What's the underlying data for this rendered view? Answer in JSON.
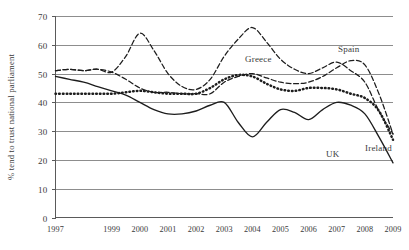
{
  "chart_data": {
    "type": "line",
    "title": "",
    "xlabel": "",
    "ylabel": "% tend to trust national parliament",
    "ylim": [
      0,
      70
    ],
    "xlim": [
      1997,
      2009
    ],
    "grid": true,
    "legend_position": "inline-annotations",
    "y_ticks": [
      "0",
      "10",
      "20",
      "30",
      "40",
      "50",
      "60",
      "70"
    ],
    "y_tick_values": [
      0,
      10,
      20,
      30,
      40,
      50,
      60,
      70
    ],
    "x_ticks": [
      "1997",
      "1999",
      "2000",
      "2001",
      "2002",
      "2003",
      "2004",
      "2005",
      "2006",
      "2007",
      "2008",
      "2009"
    ],
    "x_tick_values": [
      1997,
      1999,
      2000,
      2001,
      2002,
      2003,
      2004,
      2005,
      2006,
      2007,
      2008,
      2009
    ],
    "x": [
      1997,
      1997.5,
      1998,
      1998.5,
      1999,
      1999.5,
      2000,
      2000.5,
      2001,
      2001.5,
      2002,
      2002.5,
      2003,
      2003.5,
      2004,
      2004.5,
      2005,
      2005.5,
      2006,
      2006.5,
      2007,
      2007.5,
      2008,
      2008.5,
      2009
    ],
    "series": [
      {
        "name": "Greece",
        "style": "dashed",
        "color": "#1d1d1d",
        "values": [
          51,
          51.5,
          51,
          51.5,
          50.5,
          56,
          64,
          58,
          50,
          45.5,
          44.5,
          48,
          56,
          62,
          66,
          61,
          55,
          51.5,
          50,
          52,
          54,
          51,
          47,
          37,
          29
        ]
      },
      {
        "name": "Spain",
        "style": "dashed",
        "color": "#1d1d1d",
        "values": [
          51,
          51.5,
          51,
          51.5,
          50.5,
          48,
          45,
          43.5,
          43.5,
          43,
          43,
          43,
          47,
          49,
          50,
          48.5,
          47,
          46.5,
          47,
          49,
          52,
          54.5,
          53,
          43,
          29
        ]
      },
      {
        "name": "Ireland",
        "style": "dotted",
        "color": "#1d1d1d",
        "values": [
          43,
          43,
          43,
          43,
          43,
          43.5,
          44,
          43.5,
          43,
          43,
          43,
          45,
          48,
          49.5,
          49,
          46.5,
          44.5,
          44,
          45,
          45,
          44.5,
          43,
          41.5,
          37,
          27
        ]
      },
      {
        "name": "UK",
        "style": "solid",
        "color": "#1d1d1d",
        "values": [
          49,
          48,
          47,
          45.5,
          44,
          42.5,
          40,
          37.5,
          36,
          36,
          37,
          39,
          40,
          33,
          28,
          33,
          37.5,
          36.5,
          34,
          37.5,
          40,
          39,
          36,
          28,
          19
        ]
      }
    ],
    "annotations": [
      {
        "label": "Greece",
        "x": 245,
        "y": 62
      },
      {
        "label": "Spain",
        "x": 338,
        "y": 52
      },
      {
        "label": "UK",
        "x": 326,
        "y": 157
      },
      {
        "label": "Ireland",
        "x": 365,
        "y": 151
      }
    ]
  }
}
